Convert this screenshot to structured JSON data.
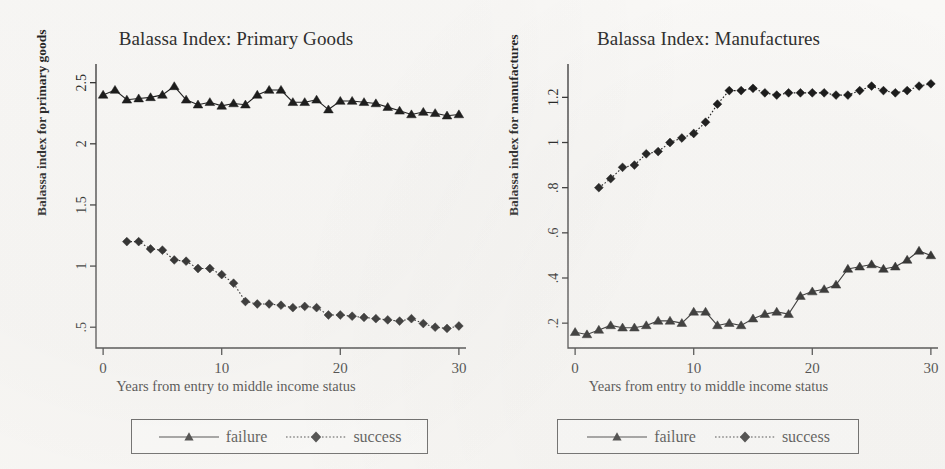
{
  "figure": {
    "background_color": "#fbfaf8",
    "ink_color": "#111111",
    "panel_count": 2
  },
  "panels": [
    {
      "id": "primary-goods",
      "title": "Balassa Index: Primary Goods",
      "y_axis_title": "Balassa index  for primary goods",
      "x_axis_title": "Years from entry to middle income status",
      "legend": {
        "failure_label": "failure",
        "success_label": "success"
      }
    },
    {
      "id": "manufactures",
      "title": "Balassa Index: Manufactures",
      "y_axis_title": "Balassa index  for manufactures",
      "x_axis_title": "Years from entry to middle income status",
      "legend": {
        "failure_label": "failure",
        "success_label": "success"
      }
    }
  ],
  "chart_data": [
    {
      "type": "line",
      "id": "primary-goods",
      "title": "Balassa Index: Primary Goods",
      "xlabel": "Years from entry to middle income status",
      "ylabel": "Balassa index  for primary goods",
      "xlim": [
        -0.6,
        30.6
      ],
      "ylim": [
        0.33,
        2.62
      ],
      "xticks": [
        0,
        10,
        20,
        30
      ],
      "xticklabels": [
        "0",
        "10",
        "20",
        "30"
      ],
      "yticks": [
        0.5,
        1,
        1.5,
        2,
        2.5
      ],
      "yticklabels": [
        ".5",
        "1",
        "1.5",
        "2",
        "2.5"
      ],
      "grid": false,
      "legend_position": "below",
      "series": [
        {
          "name": "failure",
          "marker": "triangle",
          "linestyle": "solid",
          "x": [
            0,
            1,
            2,
            3,
            4,
            5,
            6,
            7,
            8,
            9,
            10,
            11,
            12,
            13,
            14,
            15,
            16,
            17,
            18,
            19,
            20,
            21,
            22,
            23,
            24,
            25,
            26,
            27,
            28,
            29,
            30
          ],
          "values": [
            2.4,
            2.44,
            2.36,
            2.37,
            2.38,
            2.4,
            2.47,
            2.36,
            2.32,
            2.34,
            2.31,
            2.33,
            2.32,
            2.4,
            2.44,
            2.44,
            2.34,
            2.34,
            2.36,
            2.28,
            2.35,
            2.35,
            2.34,
            2.33,
            2.3,
            2.27,
            2.24,
            2.26,
            2.25,
            2.23,
            2.24
          ]
        },
        {
          "name": "success",
          "marker": "diamond",
          "linestyle": "dotted",
          "x": [
            2,
            3,
            4,
            5,
            6,
            7,
            8,
            9,
            10,
            11,
            12,
            13,
            14,
            15,
            16,
            17,
            18,
            19,
            20,
            21,
            22,
            23,
            24,
            25,
            26,
            27,
            28,
            29,
            30
          ],
          "values": [
            1.2,
            1.2,
            1.14,
            1.13,
            1.05,
            1.04,
            0.98,
            0.98,
            0.93,
            0.86,
            0.71,
            0.69,
            0.69,
            0.68,
            0.66,
            0.67,
            0.66,
            0.6,
            0.6,
            0.59,
            0.58,
            0.57,
            0.56,
            0.55,
            0.57,
            0.53,
            0.5,
            0.49,
            0.51
          ]
        }
      ]
    },
    {
      "type": "line",
      "id": "manufactures",
      "title": "Balassa Index: Manufactures",
      "xlabel": "Years from entry to middle income status",
      "ylabel": "Balassa index  for manufactures",
      "xlim": [
        -0.6,
        30.6
      ],
      "ylim": [
        0.09,
        1.33
      ],
      "xticks": [
        0,
        10,
        20,
        30
      ],
      "xticklabels": [
        "0",
        "10",
        "20",
        "30"
      ],
      "yticks": [
        0.2,
        0.4,
        0.6,
        0.8,
        1.0,
        1.2
      ],
      "yticklabels": [
        ".2",
        ".4",
        ".6",
        ".8",
        "1",
        "1.2"
      ],
      "grid": false,
      "legend_position": "below",
      "series": [
        {
          "name": "failure",
          "marker": "triangle",
          "linestyle": "solid",
          "x": [
            0,
            1,
            2,
            3,
            4,
            5,
            6,
            7,
            8,
            9,
            10,
            11,
            12,
            13,
            14,
            15,
            16,
            17,
            18,
            19,
            20,
            21,
            22,
            23,
            24,
            25,
            26,
            27,
            28,
            29,
            30
          ],
          "values": [
            0.16,
            0.15,
            0.17,
            0.19,
            0.18,
            0.18,
            0.19,
            0.21,
            0.21,
            0.2,
            0.25,
            0.25,
            0.19,
            0.2,
            0.19,
            0.22,
            0.24,
            0.25,
            0.24,
            0.32,
            0.34,
            0.35,
            0.37,
            0.44,
            0.45,
            0.46,
            0.44,
            0.45,
            0.48,
            0.52,
            0.5
          ]
        },
        {
          "name": "success",
          "marker": "diamond",
          "linestyle": "dotted",
          "x": [
            2,
            3,
            4,
            5,
            6,
            7,
            8,
            9,
            10,
            11,
            12,
            13,
            14,
            15,
            16,
            17,
            18,
            19,
            20,
            21,
            22,
            23,
            24,
            25,
            26,
            27,
            28,
            29,
            30
          ],
          "values": [
            0.8,
            0.84,
            0.89,
            0.9,
            0.95,
            0.96,
            1.0,
            1.02,
            1.04,
            1.09,
            1.17,
            1.23,
            1.23,
            1.24,
            1.22,
            1.21,
            1.22,
            1.22,
            1.22,
            1.22,
            1.21,
            1.21,
            1.23,
            1.25,
            1.23,
            1.22,
            1.23,
            1.25,
            1.26
          ]
        }
      ]
    }
  ]
}
